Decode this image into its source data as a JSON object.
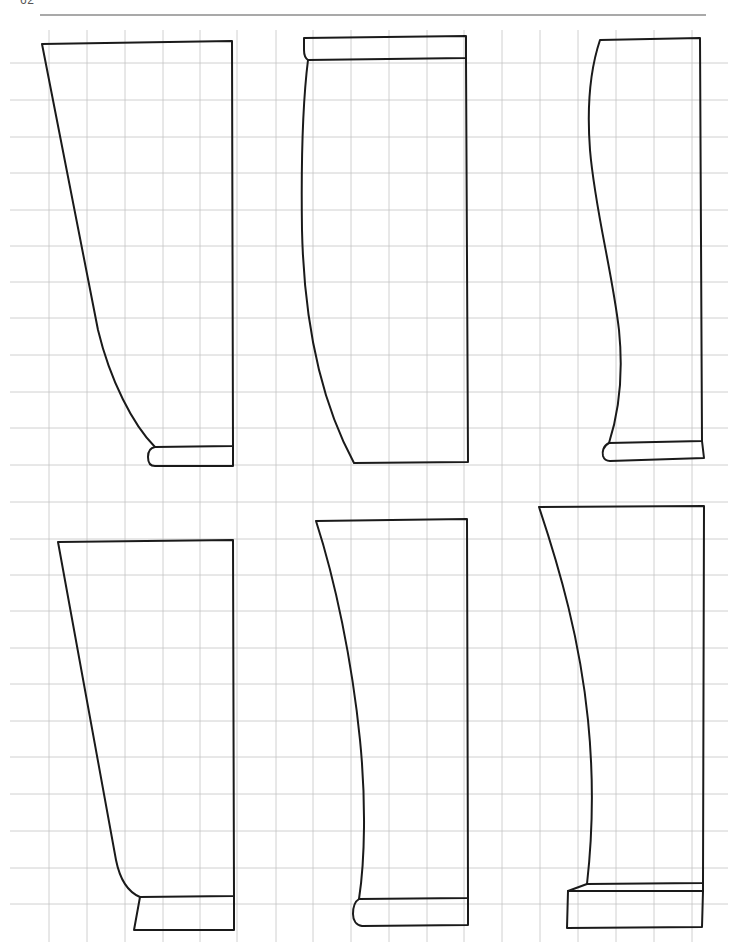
{
  "page": {
    "number": "62",
    "width": 736,
    "height": 952
  },
  "colors": {
    "background": "#ffffff",
    "grid": "#c4c4c4",
    "outline": "#1a1a1a",
    "rule": "#555555"
  },
  "grid": {
    "vertical_x": [
      49,
      87,
      125,
      163,
      200,
      237,
      276,
      313,
      351,
      389,
      427,
      464,
      502,
      540,
      578,
      616,
      654,
      692
    ],
    "vertical_y_range": [
      30,
      942
    ],
    "horizontal_y": [
      63,
      100,
      137,
      173,
      210,
      246,
      282,
      318,
      355,
      392,
      428,
      465,
      502,
      539,
      575,
      611,
      648,
      684,
      721,
      757,
      794,
      831,
      868,
      904
    ],
    "horizontal_x_range": [
      10,
      728
    ]
  },
  "header_rule": {
    "x1": 40,
    "x2": 706,
    "y": 15
  },
  "drawings": [
    {
      "name": "profile-top-left",
      "paths": [
        "M42,44 L232,41 L233,446 L155,447 C133,425 110,380 98,330 Z",
        "M155,447 C149,448 148,452 148,457 C148,463 150,466 155,466 L233,466 L233,446"
      ]
    },
    {
      "name": "profile-top-center",
      "paths": [
        "M304,38 L466,36 L466,58 L308,60 C305,58 304,55 304,50 Z",
        "M308,60 C303,100 301,160 302,230 C304,320 320,400 354,463 L468,462 L466,58"
      ]
    },
    {
      "name": "profile-top-right",
      "paths": [
        "M600,40 L700,38 L702,441 L609,443 C618,415 624,380 619,330 C612,270 595,210 590,150 C587,110 590,70 600,40 Z",
        "M609,443 C603,446 602,452 603,456 C604,459 606,461 610,461 L704,458 L702,441"
      ]
    },
    {
      "name": "profile-bottom-left",
      "paths": [
        "M58,542 L233,540 L234,896 L140,897 C128,892 120,880 116,860 L58,542 Z",
        "M140,897 L134,930 L234,930 L234,896"
      ]
    },
    {
      "name": "profile-bottom-center",
      "paths": [
        "M316,521 L467,519 L468,898 L359,899 C365,860 366,800 360,740 C352,660 335,580 316,521 Z",
        "M359,899 C354,902 353,908 353,914 C353,920 356,925 362,926 L468,925 L468,898"
      ]
    },
    {
      "name": "profile-bottom-right",
      "paths": [
        "M539,507 L704,506 L703,883 L587,884 C592,840 594,780 588,720 C580,640 560,570 539,507 Z",
        "M587,884 L568,891 L703,891 L703,883",
        "M568,891 L567,928 L702,927 L703,891"
      ]
    }
  ]
}
